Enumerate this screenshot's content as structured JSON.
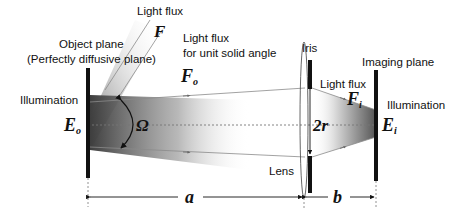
{
  "diagram": {
    "labels": {
      "light_flux_top": "Light flux",
      "flux_symbol": "F",
      "object_plane_line1": "Object plane",
      "object_plane_line2": "(Perfectly diffusive plane)",
      "unit_solid_angle_line1": "Light flux",
      "unit_solid_angle_line2": "for unit solid angle",
      "fo_symbol": "F",
      "fo_sub": "o",
      "illumination_left": "Illumination",
      "eo_symbol": "E",
      "eo_sub": "o",
      "omega_symbol": "Ω",
      "iris": "Iris",
      "lens": "Lens",
      "aperture": "2r",
      "imaging_plane": "Imaging plane",
      "light_flux_image": "Light flux",
      "fi_symbol": "F",
      "fi_sub": "i",
      "illumination_right": "Illumination",
      "ei_symbol": "E",
      "ei_sub": "i",
      "distance_a": "a",
      "distance_b": "b"
    },
    "colors": {
      "line": "#111111",
      "thin_line": "#8a8a8a",
      "beam_dark": "#4a4a4a",
      "beam_light": "#ffffff"
    }
  }
}
